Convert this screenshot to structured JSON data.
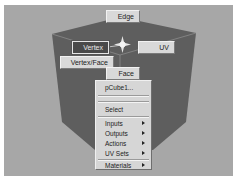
{
  "viewport": {
    "background": "#a7a7a7",
    "object_color": "#5e5e5e"
  },
  "marking_menu": {
    "north": {
      "label": "Edge"
    },
    "west": {
      "label": "Vertex",
      "selected": true
    },
    "east": {
      "label": "UV"
    },
    "southwest": {
      "label": "Vertex/Face"
    },
    "south": {
      "label": "Face"
    },
    "center_icon": "star-icon"
  },
  "context_menu": {
    "items": [
      {
        "label": "pCube1...",
        "has_submenu": false
      },
      {
        "type": "separator"
      },
      {
        "label": "Select",
        "has_submenu": false
      },
      {
        "type": "separator"
      },
      {
        "label": "Inputs",
        "has_submenu": true
      },
      {
        "label": "Outputs",
        "has_submenu": true
      },
      {
        "label": "Actions",
        "has_submenu": true
      },
      {
        "label": "UV Sets",
        "has_submenu": true
      },
      {
        "type": "separator"
      },
      {
        "label": "Materials",
        "has_submenu": true
      }
    ]
  }
}
